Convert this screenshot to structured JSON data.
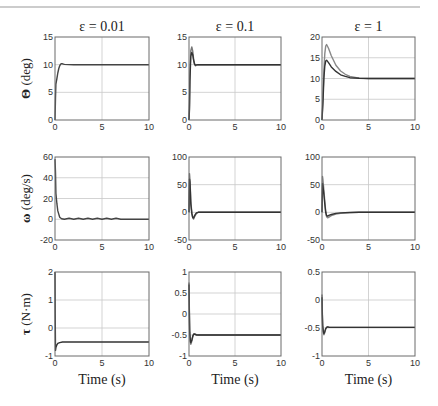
{
  "page": {
    "header_rule": true,
    "page_number_fragment": "..."
  },
  "chart_data": {
    "type": "line",
    "layout": "3x3 grid of subplots",
    "grid": true,
    "columns": [
      {
        "title": "ε = 0.01"
      },
      {
        "title": "ε = 0.1"
      },
      {
        "title": "ε = 1"
      }
    ],
    "rows": [
      {
        "ylabel_symbol": "Θ",
        "ylabel_unit": " (deg)"
      },
      {
        "ylabel_symbol": "ω",
        "ylabel_unit": " (deg/s)"
      },
      {
        "ylabel_symbol": "τ",
        "ylabel_unit": " (N·m)"
      }
    ],
    "xlabel": "Time (s)",
    "xlim": [
      0,
      10
    ],
    "xticks": [
      "0",
      "5",
      "10"
    ],
    "subplots": [
      {
        "row": 0,
        "col": 0,
        "ylim": [
          0,
          15
        ],
        "yticks": [
          "0",
          "5",
          "10",
          "15"
        ],
        "series": [
          {
            "name": "response",
            "color": "#444444",
            "x": [
              0,
              0.05,
              0.1,
              0.2,
              0.3,
              0.4,
              0.5,
              0.6,
              0.7,
              0.8,
              1.0,
              2,
              5,
              10
            ],
            "y": [
              0,
              4,
              6.5,
              7.5,
              8.5,
              9.3,
              9.8,
              10.1,
              10.2,
              10.15,
              10.05,
              10,
              10,
              10
            ]
          }
        ]
      },
      {
        "row": 0,
        "col": 1,
        "ylim": [
          0,
          15
        ],
        "yticks": [
          "0",
          "5",
          "10",
          "15"
        ],
        "series": [
          {
            "name": "response A",
            "color": "#777777",
            "x": [
              0,
              0.05,
              0.1,
              0.2,
              0.3,
              0.4,
              0.5,
              0.6,
              0.7,
              0.8,
              1.0,
              2,
              5,
              10
            ],
            "y": [
              0,
              3,
              8,
              12.5,
              13.2,
              12.5,
              11,
              10.2,
              9.8,
              9.9,
              10,
              10,
              10,
              10
            ]
          },
          {
            "name": "response B",
            "color": "#333333",
            "x": [
              0,
              0.05,
              0.1,
              0.2,
              0.3,
              0.4,
              0.5,
              0.6,
              0.7,
              0.8,
              1.0,
              2,
              5,
              10
            ],
            "y": [
              0,
              2,
              7,
              11.5,
              12.2,
              11.8,
              10.8,
              10.1,
              9.9,
              9.95,
              10,
              10,
              10,
              10
            ]
          }
        ]
      },
      {
        "row": 0,
        "col": 2,
        "ylim": [
          0,
          20
        ],
        "yticks": [
          "0",
          "5",
          "10",
          "15",
          "20"
        ],
        "series": [
          {
            "name": "response A",
            "color": "#888888",
            "x": [
              0,
              0.1,
              0.2,
              0.3,
              0.4,
              0.5,
              0.7,
              1.0,
              1.5,
              2,
              2.5,
              3,
              4,
              5,
              10
            ],
            "y": [
              0,
              5,
              12,
              16,
              17.8,
              18.2,
              17.3,
              15.5,
              13.2,
              11.8,
              11,
              10.5,
              10.1,
              10,
              10
            ]
          },
          {
            "name": "response B",
            "color": "#333333",
            "x": [
              0,
              0.1,
              0.2,
              0.3,
              0.4,
              0.5,
              0.7,
              1.0,
              1.5,
              2,
              2.5,
              3,
              4,
              5,
              10
            ],
            "y": [
              0,
              4,
              10,
              13,
              14.2,
              14.4,
              13.8,
              12.8,
              11.7,
              10.9,
              10.5,
              10.2,
              10.05,
              10,
              10
            ]
          }
        ]
      },
      {
        "row": 1,
        "col": 0,
        "ylim": [
          -20,
          60
        ],
        "yticks": [
          "-20",
          "0",
          "20",
          "40",
          "60"
        ],
        "series": [
          {
            "name": "response",
            "color": "#444444",
            "x": [
              0,
              0.05,
              0.1,
              0.2,
              0.3,
              0.5,
              0.7,
              1.0,
              1.5,
              2,
              2.5,
              3,
              3.5,
              4,
              4.5,
              5,
              5.5,
              6,
              6.5,
              7,
              7.5,
              10
            ],
            "y": [
              58,
              45,
              25,
              15,
              8,
              2,
              0.5,
              0,
              1,
              0,
              1,
              0,
              1,
              0,
              1,
              0,
              1,
              0,
              1,
              0,
              0,
              0
            ]
          }
        ]
      },
      {
        "row": 1,
        "col": 1,
        "ylim": [
          -50,
          100
        ],
        "yticks": [
          "-50",
          "0",
          "50",
          "100"
        ],
        "series": [
          {
            "name": "response A",
            "color": "#777777",
            "x": [
              0,
              0.05,
              0.1,
              0.15,
              0.2,
              0.3,
              0.4,
              0.5,
              0.6,
              0.8,
              1.0,
              2,
              5,
              10
            ],
            "y": [
              0,
              70,
              60,
              40,
              20,
              0,
              -10,
              -12,
              -8,
              -2,
              0,
              0,
              0,
              0
            ]
          },
          {
            "name": "response B",
            "color": "#333333",
            "x": [
              0,
              0.05,
              0.1,
              0.15,
              0.2,
              0.3,
              0.4,
              0.5,
              0.6,
              0.8,
              1.0,
              2,
              5,
              10
            ],
            "y": [
              0,
              60,
              55,
              35,
              15,
              -2,
              -9,
              -10,
              -6,
              -1,
              0,
              0,
              0,
              0
            ]
          }
        ]
      },
      {
        "row": 1,
        "col": 2,
        "ylim": [
          -50,
          100
        ],
        "yticks": [
          "-50",
          "0",
          "50",
          "100"
        ],
        "series": [
          {
            "name": "response A",
            "color": "#888888",
            "x": [
              0,
              0.05,
              0.1,
              0.2,
              0.3,
              0.4,
              0.5,
              0.6,
              0.8,
              1.0,
              1.5,
              2,
              3,
              4,
              10
            ],
            "y": [
              0,
              65,
              60,
              40,
              20,
              2,
              -8,
              -10,
              -8,
              -6,
              -3,
              -2,
              -0.5,
              0,
              0
            ]
          },
          {
            "name": "response B",
            "color": "#333333",
            "x": [
              0,
              0.05,
              0.1,
              0.2,
              0.3,
              0.4,
              0.5,
              0.6,
              0.8,
              1.0,
              1.5,
              2,
              3,
              4,
              10
            ],
            "y": [
              0,
              52,
              48,
              32,
              15,
              0,
              -6,
              -7,
              -5,
              -4,
              -2,
              -1,
              -0.3,
              0,
              0
            ]
          }
        ]
      },
      {
        "row": 2,
        "col": 0,
        "ylim": [
          -1,
          2
        ],
        "yticks": [
          "-1",
          "0",
          "1",
          "2"
        ],
        "series": [
          {
            "name": "response",
            "color": "#333333",
            "x": [
              0,
              0.02,
              0.05,
              0.1,
              0.2,
              0.3,
              0.5,
              0.8,
              1.0,
              2,
              5,
              10
            ],
            "y": [
              2,
              0.5,
              -0.8,
              -0.7,
              -0.6,
              -0.55,
              -0.52,
              -0.5,
              -0.5,
              -0.5,
              -0.5,
              -0.5
            ]
          }
        ]
      },
      {
        "row": 2,
        "col": 1,
        "ylim": [
          -1,
          1
        ],
        "yticks": [
          "-1",
          "-0.5",
          "0",
          "0.5",
          "1"
        ],
        "series": [
          {
            "name": "response A",
            "color": "#777777",
            "x": [
              0,
              0.03,
              0.08,
              0.15,
              0.2,
              0.3,
              0.4,
              0.5,
              0.6,
              0.8,
              1.0,
              2,
              5,
              10
            ],
            "y": [
              0.75,
              0.2,
              -0.4,
              -0.68,
              -0.72,
              -0.65,
              -0.55,
              -0.48,
              -0.47,
              -0.49,
              -0.5,
              -0.5,
              -0.5,
              -0.5
            ]
          },
          {
            "name": "response B",
            "color": "#333333",
            "x": [
              0,
              0.03,
              0.08,
              0.15,
              0.2,
              0.3,
              0.4,
              0.5,
              0.6,
              0.8,
              1.0,
              2,
              5,
              10
            ],
            "y": [
              0.7,
              0.1,
              -0.45,
              -0.65,
              -0.68,
              -0.62,
              -0.53,
              -0.48,
              -0.48,
              -0.5,
              -0.5,
              -0.5,
              -0.5,
              -0.5
            ]
          }
        ]
      },
      {
        "row": 2,
        "col": 2,
        "ylim": [
          -1,
          0.5
        ],
        "yticks": [
          "-1",
          "-0.5",
          "0",
          "0.5"
        ],
        "series": [
          {
            "name": "response A",
            "color": "#777777",
            "x": [
              0,
              0.03,
              0.08,
              0.15,
              0.2,
              0.3,
              0.4,
              0.5,
              0.6,
              0.8,
              1.0,
              2,
              5,
              10
            ],
            "y": [
              0.1,
              -0.2,
              -0.45,
              -0.58,
              -0.62,
              -0.58,
              -0.52,
              -0.49,
              -0.48,
              -0.49,
              -0.49,
              -0.49,
              -0.49,
              -0.49
            ]
          },
          {
            "name": "response B",
            "color": "#333333",
            "x": [
              0,
              0.03,
              0.08,
              0.15,
              0.2,
              0.3,
              0.4,
              0.5,
              0.6,
              0.8,
              1.0,
              2,
              5,
              10
            ],
            "y": [
              0.05,
              -0.25,
              -0.48,
              -0.57,
              -0.6,
              -0.56,
              -0.51,
              -0.49,
              -0.48,
              -0.49,
              -0.49,
              -0.49,
              -0.49,
              -0.49
            ]
          }
        ]
      }
    ]
  }
}
